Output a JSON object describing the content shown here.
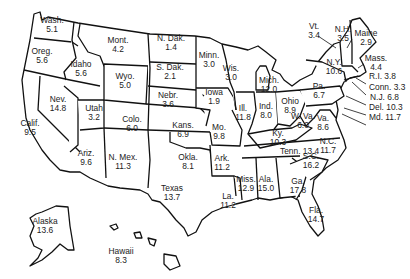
{
  "map": {
    "type": "choropleth-outline",
    "region": "United States",
    "states": [
      {
        "name": "Wash.",
        "value": "5.1",
        "x": 52,
        "y": 25
      },
      {
        "name": "Oreg.",
        "value": "5.6",
        "x": 42,
        "y": 56
      },
      {
        "name": "Calif.",
        "value": "9.5",
        "x": 30,
        "y": 128
      },
      {
        "name": "Idaho",
        "value": "5.6",
        "x": 81,
        "y": 69
      },
      {
        "name": "Nev.",
        "value": "14.8",
        "x": 58,
        "y": 104
      },
      {
        "name": "Utah",
        "value": "3.2",
        "x": 94,
        "y": 113
      },
      {
        "name": "Ariz.",
        "value": "9.6",
        "x": 86,
        "y": 158
      },
      {
        "name": "Mont.",
        "value": "4.2",
        "x": 118,
        "y": 45
      },
      {
        "name": "Wyo.",
        "value": "5.0",
        "x": 125,
        "y": 81
      },
      {
        "name": "Colo.",
        "value": "6.0",
        "x": 132,
        "y": 124
      },
      {
        "name": "N. Mex.",
        "value": "11.3",
        "x": 123,
        "y": 162
      },
      {
        "name": "N. Dak.",
        "value": "1.4",
        "x": 171,
        "y": 43
      },
      {
        "name": "S. Dak.",
        "value": "2.1",
        "x": 170,
        "y": 72
      },
      {
        "name": "Nebr.",
        "value": "3.6",
        "x": 168,
        "y": 100
      },
      {
        "name": "Kans.",
        "value": "6.9",
        "x": 183,
        "y": 130
      },
      {
        "name": "Okla.",
        "value": "8.1",
        "x": 188,
        "y": 162
      },
      {
        "name": "Texas",
        "value": "13.7",
        "x": 172,
        "y": 193
      },
      {
        "name": "Minn.",
        "value": "3.0",
        "x": 209,
        "y": 60
      },
      {
        "name": "Iowa",
        "value": "1.9",
        "x": 214,
        "y": 97
      },
      {
        "name": "Mo.",
        "value": "9.8",
        "x": 219,
        "y": 132
      },
      {
        "name": "Ark.",
        "value": "11.2",
        "x": 222,
        "y": 163
      },
      {
        "name": "La.",
        "value": "11.2",
        "x": 228,
        "y": 201
      },
      {
        "name": "Wis.",
        "value": "3.0",
        "x": 231,
        "y": 73
      },
      {
        "name": "Ill.",
        "value": "11.8",
        "x": 243,
        "y": 113
      },
      {
        "name": "Mich.",
        "value": "12.0",
        "x": 269,
        "y": 85
      },
      {
        "name": "Ind.",
        "value": "8.0",
        "x": 266,
        "y": 111
      },
      {
        "name": "Ohio",
        "value": "8.9",
        "x": 290,
        "y": 106
      },
      {
        "name": "Ky.",
        "value": "10.3",
        "x": 278,
        "y": 138
      },
      {
        "name": "Tenn.",
        "value": "13.4",
        "x": 280,
        "y": 156
      },
      {
        "name": "Miss.",
        "value": "12.9",
        "x": 246,
        "y": 184
      },
      {
        "name": "Ala.",
        "value": "15.0",
        "x": 266,
        "y": 184
      },
      {
        "name": "Ga.",
        "value": "17.8",
        "x": 298,
        "y": 186
      },
      {
        "name": "Fla.",
        "value": "14.7",
        "x": 316,
        "y": 215
      },
      {
        "name": "S.C.",
        "value": "16.2",
        "x": 311,
        "y": 161
      },
      {
        "name": "N.C.",
        "value": "11.7",
        "x": 328,
        "y": 146
      },
      {
        "name": "Va.",
        "value": "8.6",
        "x": 323,
        "y": 123
      },
      {
        "name": "W. Va.",
        "value": "6.0",
        "x": 303,
        "y": 121
      },
      {
        "name": "Pa.",
        "value": "6.7",
        "x": 319,
        "y": 91
      },
      {
        "name": "N.Y.",
        "value": "10.6",
        "x": 334,
        "y": 67
      },
      {
        "name": "Vt.",
        "value": "3.4",
        "x": 314,
        "y": 31
      },
      {
        "name": "N.H.",
        "value": "3.5",
        "x": 343,
        "y": 34
      },
      {
        "name": "Maine",
        "value": "2.9",
        "x": 366,
        "y": 38
      },
      {
        "name": "Mass.",
        "value": "4.4",
        "x": 376,
        "y": 63
      },
      {
        "name": "R.I.",
        "value": "3.8",
        "x": 369,
        "y": 81
      },
      {
        "name": "Conn.",
        "value": "3.3",
        "x": 369,
        "y": 92
      },
      {
        "name": "N.J.",
        "value": "6.8",
        "x": 370,
        "y": 102
      },
      {
        "name": "Del.",
        "value": "10.3",
        "x": 369,
        "y": 112
      },
      {
        "name": "Md.",
        "value": "11.7",
        "x": 369,
        "y": 122
      },
      {
        "name": "Alaska",
        "value": "13.6",
        "x": 45,
        "y": 226
      },
      {
        "name": "Hawaii",
        "value": "8.3",
        "x": 121,
        "y": 256
      }
    ]
  }
}
